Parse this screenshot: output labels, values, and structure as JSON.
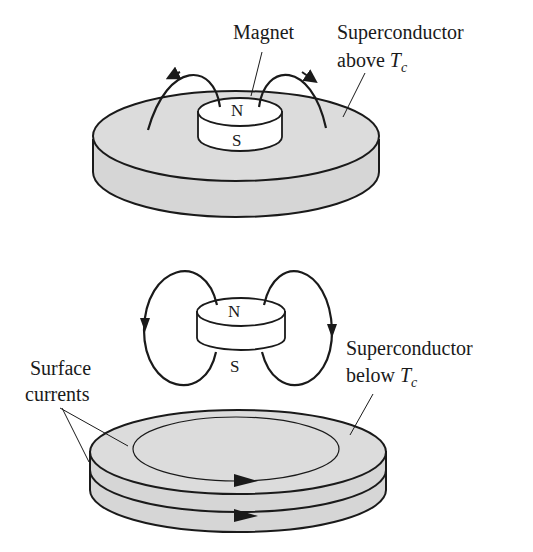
{
  "figure": {
    "top_panel": {
      "magnet_label": "Magnet",
      "sc_label_line1": "Superconductor",
      "sc_label_line2_prefix": "above ",
      "temp_symbol": "T",
      "temp_subscript": "c",
      "pole_north": "N",
      "pole_south": "S"
    },
    "bottom_panel": {
      "surface_label_line1": "Surface",
      "surface_label_line2": "currents",
      "sc_label_line1": "Superconductor",
      "sc_label_line2_prefix": "below ",
      "temp_symbol": "T",
      "temp_subscript": "c",
      "pole_north": "N",
      "pole_south": "S"
    },
    "colors": {
      "disk_fill": "#d9d9d9",
      "magnet_fill": "#ffffff",
      "stroke": "#1a1a1a"
    }
  }
}
